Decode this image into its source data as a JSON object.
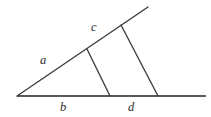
{
  "figure": {
    "background_color": "#ffffff",
    "baseline_color": "#5a5a5a",
    "line_color": "#3b3b3b",
    "label_color": "#2e2e2e",
    "canvas": {
      "width": 211,
      "height": 117
    }
  },
  "labels": {
    "a": "a",
    "b": "b",
    "c": "c",
    "d": "d"
  },
  "geometry": {
    "vertex": {
      "x": 17,
      "y": 96
    },
    "baseline_end": {
      "x": 206,
      "y": 96
    },
    "ray_end": {
      "x": 148,
      "y": 7
    },
    "transversal_1": {
      "top": {
        "x": 87,
        "y": 49
      },
      "bottom": {
        "x": 110,
        "y": 96
      }
    },
    "transversal_2": {
      "top": {
        "x": 121,
        "y": 25
      },
      "bottom": {
        "x": 158,
        "y": 96
      }
    },
    "label_positions": {
      "a": {
        "x": 40,
        "y": 54
      },
      "b": {
        "x": 60,
        "y": 101
      },
      "c": {
        "x": 91,
        "y": 21
      },
      "d": {
        "x": 128,
        "y": 101
      }
    }
  }
}
